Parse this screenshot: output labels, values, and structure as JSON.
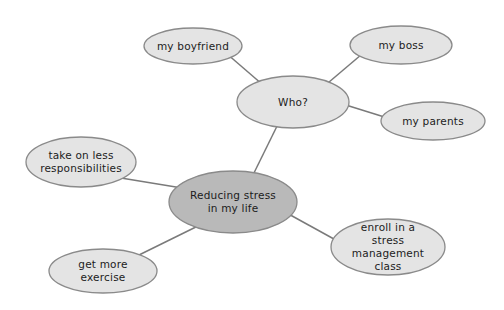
{
  "diagram": {
    "canvas": {
      "width": 504,
      "height": 310,
      "background": "#ffffff"
    },
    "colors": {
      "node_fill": "#e4e4e4",
      "center_node_fill": "#b9b9b9",
      "node_stroke": "#8a8a8a",
      "edge_color": "#7a7a7a",
      "text_color": "#1c1c1c"
    },
    "nodes": [
      {
        "id": "center",
        "label": "Reducing stress in my life",
        "lines": [
          "Reducing stress",
          "in my life"
        ],
        "cx": 233,
        "cy": 202,
        "rx": 64,
        "ry": 31,
        "emphasis": true
      },
      {
        "id": "who",
        "label": "Who?",
        "lines": [
          "Who?"
        ],
        "cx": 293,
        "cy": 102,
        "rx": 56,
        "ry": 26,
        "emphasis": false
      },
      {
        "id": "boyfriend",
        "label": "my boyfriend",
        "lines": [
          "my boyfriend"
        ],
        "cx": 193,
        "cy": 46,
        "rx": 49,
        "ry": 18,
        "emphasis": false
      },
      {
        "id": "boss",
        "label": "my boss",
        "lines": [
          "my boss"
        ],
        "cx": 401,
        "cy": 45,
        "rx": 51,
        "ry": 19,
        "emphasis": false
      },
      {
        "id": "parents",
        "label": "my parents",
        "lines": [
          "my parents"
        ],
        "cx": 433,
        "cy": 121,
        "rx": 52,
        "ry": 19,
        "emphasis": false
      },
      {
        "id": "responsibilities",
        "label": "take on less responsibilities",
        "lines": [
          "take on less",
          "responsibilities"
        ],
        "cx": 81,
        "cy": 162,
        "rx": 55,
        "ry": 25,
        "emphasis": false
      },
      {
        "id": "exercise",
        "label": "get more exercise",
        "lines": [
          "get more",
          "exercise"
        ],
        "cx": 103,
        "cy": 271,
        "rx": 54,
        "ry": 22,
        "emphasis": false
      },
      {
        "id": "enroll",
        "label": "enroll in a stress management class",
        "lines": [
          "enroll in a",
          "stress",
          "management",
          "class"
        ],
        "cx": 388,
        "cy": 247,
        "rx": 57,
        "ry": 28,
        "emphasis": false
      }
    ],
    "edges": [
      {
        "from": "boyfriend",
        "to": "who",
        "x1": 219,
        "y1": 47,
        "x2": 270,
        "y2": 91
      },
      {
        "from": "who",
        "to": "boss",
        "x1": 322,
        "y1": 88,
        "x2": 368,
        "y2": 49
      },
      {
        "from": "who",
        "to": "parents",
        "x1": 333,
        "y1": 101,
        "x2": 394,
        "y2": 120
      },
      {
        "from": "who",
        "to": "center",
        "x1": 282,
        "y1": 116,
        "x2": 250,
        "y2": 181
      },
      {
        "from": "responsibilities",
        "to": "center",
        "x1": 121,
        "y1": 178,
        "x2": 182,
        "y2": 188
      },
      {
        "from": "center",
        "to": "exercise",
        "x1": 204,
        "y1": 223,
        "x2": 139,
        "y2": 255
      },
      {
        "from": "center",
        "to": "enroll",
        "x1": 274,
        "y1": 206,
        "x2": 343,
        "y2": 244
      }
    ]
  }
}
